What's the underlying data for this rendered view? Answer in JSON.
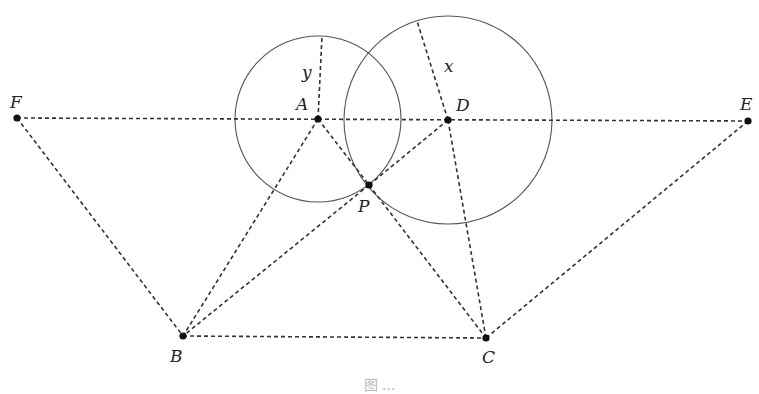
{
  "figure": {
    "points": [
      {
        "name": "F",
        "x": 17,
        "y": 118,
        "lx": 10,
        "ly": 108
      },
      {
        "name": "A",
        "x": 318,
        "y": 119,
        "lx": 296,
        "ly": 110
      },
      {
        "name": "D",
        "x": 448,
        "y": 120,
        "lx": 456,
        "ly": 111
      },
      {
        "name": "E",
        "x": 748,
        "y": 121,
        "lx": 740,
        "ly": 110
      },
      {
        "name": "P",
        "x": 369,
        "y": 185,
        "lx": 358,
        "ly": 212
      },
      {
        "name": "B",
        "x": 183,
        "y": 336,
        "lx": 170,
        "ly": 362
      },
      {
        "name": "C",
        "x": 486,
        "y": 338,
        "lx": 482,
        "ly": 363
      }
    ],
    "circles": [
      {
        "name": "circle-A",
        "cx": 318,
        "cy": 119,
        "r": 83
      },
      {
        "name": "circle-D",
        "cx": 448,
        "cy": 120,
        "r": 104
      }
    ],
    "radius_labels": [
      {
        "text": "y",
        "x": 302,
        "y": 78,
        "from": [
          318,
          119
        ],
        "to": [
          322,
          36
        ]
      },
      {
        "text": "x",
        "x": 444,
        "y": 72,
        "from": [
          448,
          120
        ],
        "to": [
          417,
          21
        ]
      }
    ],
    "segments": [
      [
        "F",
        "E"
      ],
      [
        "F",
        "B"
      ],
      [
        "E",
        "C"
      ],
      [
        "B",
        "C"
      ],
      [
        "A",
        "B"
      ],
      [
        "A",
        "P"
      ],
      [
        "P",
        "C"
      ],
      [
        "D",
        "P"
      ],
      [
        "P",
        "B"
      ],
      [
        "D",
        "C"
      ]
    ]
  },
  "caption": {
    "text": "图 ..."
  }
}
